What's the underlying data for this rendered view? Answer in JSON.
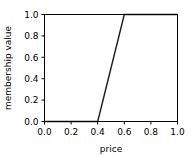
{
  "chart_data": {
    "type": "line",
    "title": "",
    "subtitle": "",
    "xlabel": "price",
    "ylabel": "membership value",
    "xlim": [
      0.0,
      1.0
    ],
    "ylim": [
      0.0,
      1.0
    ],
    "xticks": [
      "0.0",
      "0.2",
      "0.4",
      "0.6",
      "0.8",
      "1.0"
    ],
    "xtick_values": [
      0.0,
      0.2,
      0.4,
      0.6,
      0.8,
      1.0
    ],
    "yticks": [
      "0.0",
      "0.2",
      "0.4",
      "0.6",
      "0.8",
      "1.0"
    ],
    "ytick_values": [
      0.0,
      0.2,
      0.4,
      0.6,
      0.8,
      1.0
    ],
    "grid": false,
    "legend": null,
    "legend_position": "none",
    "annotations": [],
    "series": [
      {
        "name": "membership",
        "color": "#1a1a1a",
        "linewidth": 1.4,
        "x": [
          0.0,
          0.4,
          0.6,
          1.0
        ],
        "values": [
          0.0,
          0.0,
          1.0,
          1.0
        ]
      }
    ]
  },
  "figure": {
    "background_color": "#ffffff",
    "axes_color": "#000000",
    "line_color": "#1a1a1a"
  }
}
